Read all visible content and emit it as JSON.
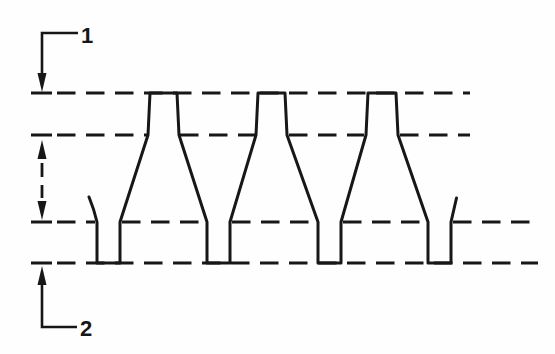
{
  "diagram": {
    "background_color": "#fefefe",
    "stroke_color": "#171717",
    "callout_top": {
      "label": "1"
    },
    "callout_bottom": {
      "label": "2"
    }
  }
}
